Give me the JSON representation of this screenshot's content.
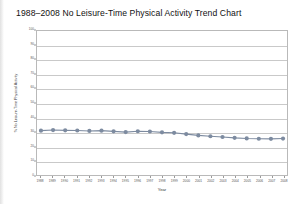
{
  "chart_data": {
    "type": "line",
    "title": "1988–2008 No Leisure-Time Physical Activity Trend Chart",
    "xlabel": "Year",
    "ylabel": "% No Leisure-Time Physical Activity",
    "ylim": [
      0,
      100
    ],
    "ytick_labels": [
      "100",
      "90",
      "80",
      "70",
      "60",
      "50",
      "40",
      "30",
      "20",
      "10",
      "0"
    ],
    "ytick_values": [
      100,
      90,
      80,
      70,
      60,
      50,
      40,
      30,
      20,
      10,
      0
    ],
    "grid": true,
    "legend": "none",
    "categories": [
      "1988",
      "1989",
      "1990",
      "1991",
      "1992",
      "1993",
      "1994",
      "1995",
      "1996",
      "1997",
      "1998",
      "1999",
      "2000",
      "2001",
      "2002",
      "2003",
      "2004",
      "2005",
      "2006",
      "2007",
      "2008"
    ],
    "values": [
      30.8,
      31.2,
      31.0,
      30.9,
      30.6,
      30.8,
      30.3,
      29.8,
      30.4,
      30.2,
      29.6,
      29.3,
      28.4,
      27.5,
      26.9,
      26.4,
      25.8,
      25.4,
      25.2,
      25.1,
      25.3
    ],
    "series": [
      {
        "name": "% No Leisure-Time Physical Activity",
        "color": "#7d8ba0",
        "marker": "circle",
        "values": [
          30.8,
          31.2,
          31.0,
          30.9,
          30.6,
          30.8,
          30.3,
          29.8,
          30.4,
          30.2,
          29.6,
          29.3,
          28.4,
          27.5,
          26.9,
          26.4,
          25.8,
          25.4,
          25.2,
          25.1,
          25.3
        ]
      }
    ]
  },
  "colors": {
    "series": "#7d8ba0",
    "grid": "#c9c9c9",
    "frame": "#b9b9b9",
    "title": "#111111"
  }
}
